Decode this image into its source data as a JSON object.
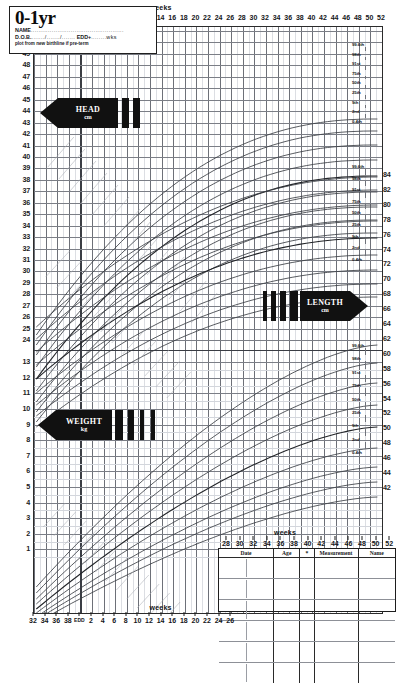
{
  "chart_data": {
    "type": "line",
    "title": "0-1yr",
    "subtitle": "UK-WHO growth chart, 0-1 year",
    "xlabel": "weeks",
    "x_axis": {
      "label": "weeks",
      "gestational_ticks": [
        "32",
        "34",
        "36",
        "38",
        "EDD"
      ],
      "postnatal_ticks": [
        "2",
        "4",
        "6",
        "8",
        "10",
        "12",
        "14",
        "16",
        "18",
        "20",
        "22",
        "24",
        "26",
        "28",
        "30",
        "32",
        "34",
        "36",
        "38",
        "40",
        "42",
        "44",
        "46",
        "48",
        "50",
        "52"
      ],
      "range_weeks": [
        32,
        52
      ],
      "edd_marker": "EDD"
    },
    "panels": [
      {
        "name": "head-circumference",
        "measure": "HEAD",
        "unit": "cm",
        "ylabel": "cm",
        "yticks": [
          "51",
          "50",
          "49",
          "48",
          "47",
          "46",
          "45",
          "44",
          "43",
          "42",
          "41",
          "40",
          "39",
          "38",
          "37",
          "36",
          "35",
          "34",
          "33",
          "32",
          "31",
          "30",
          "29",
          "28",
          "27",
          "26",
          "25",
          "24"
        ],
        "ylim": [
          24,
          51
        ],
        "percentiles": [
          "99.6th",
          "98th",
          "91st",
          "75th",
          "50th",
          "25th",
          "9th",
          "2nd",
          "0.4th"
        ]
      },
      {
        "name": "length",
        "measure": "LENGTH",
        "unit": "cm",
        "ylabel": "cm",
        "yticks_right": [
          "84",
          "82",
          "80",
          "78",
          "76",
          "74",
          "72",
          "70",
          "68",
          "66",
          "64",
          "62",
          "60",
          "58",
          "56",
          "54",
          "52",
          "50",
          "48",
          "46",
          "44",
          "42"
        ],
        "ylim": [
          42,
          84
        ],
        "percentiles": [
          "99.6th",
          "98th",
          "91st",
          "75th",
          "50th",
          "25th",
          "9th",
          "2nd",
          "0.4th"
        ]
      },
      {
        "name": "weight",
        "measure": "WEIGHT",
        "unit": "kg",
        "ylabel": "kg",
        "yticks": [
          "13",
          "12",
          "11",
          "10",
          "9",
          "8",
          "7",
          "6",
          "5",
          "4",
          "3",
          "2",
          "1"
        ],
        "ylim": [
          1,
          13
        ],
        "percentiles": [
          "99.6th",
          "98th",
          "91st",
          "75th",
          "50th",
          "25th",
          "9th",
          "2nd",
          "0.4th"
        ]
      }
    ],
    "grid": true,
    "legend_position": "right-inline-percentile-labels"
  },
  "header": {
    "title": "0-1yr",
    "name_label": "NAME",
    "name_dots": ".................................................",
    "dob_label": "D.O.B.",
    "dob_dots": "......./......./.......",
    "edd_label": "EDD+",
    "edd_dots": "........wks",
    "note": "plot from new birthline if pre-term"
  },
  "axis_labels": {
    "weeks_top": "weeks",
    "weeks_bottom": "weeks",
    "weeks_table": "weeks"
  },
  "measure_arrows": [
    {
      "id": "head",
      "label": "HEAD",
      "unit": "cm",
      "direction": "left",
      "bars": 2
    },
    {
      "id": "length",
      "label": "LENGTH",
      "unit": "cm",
      "direction": "right",
      "bars": 4
    },
    {
      "id": "weight",
      "label": "WEIGHT",
      "unit": "kg",
      "direction": "left",
      "bars": 4
    }
  ],
  "left_ticks_head": [
    "51",
    "50",
    "49",
    "48",
    "47",
    "46",
    "45",
    "44",
    "43",
    "42",
    "41",
    "40",
    "39",
    "38",
    "37",
    "36",
    "35",
    "34",
    "33",
    "32",
    "31",
    "30",
    "29",
    "28",
    "27",
    "26",
    "25",
    "24"
  ],
  "left_ticks_weight": [
    "13",
    "12",
    "11",
    "10",
    "9",
    "8",
    "7",
    "6",
    "5",
    "4",
    "3",
    "2",
    "1"
  ],
  "right_ticks_length": [
    "84",
    "82",
    "80",
    "78",
    "76",
    "74",
    "72",
    "70",
    "68",
    "66",
    "64",
    "62",
    "60",
    "58",
    "56",
    "54",
    "52",
    "50",
    "48",
    "46",
    "44",
    "42"
  ],
  "percentile_labels": [
    "99.6th",
    "98th",
    "91st",
    "75th",
    "50th",
    "25th",
    "9th",
    "2nd",
    "0.4th"
  ],
  "x_ticks_gest": [
    "32",
    "34",
    "36",
    "38",
    "EDD"
  ],
  "x_ticks_post": [
    "2",
    "4",
    "6",
    "8",
    "10",
    "12",
    "14",
    "16",
    "18",
    "20",
    "22",
    "24",
    "26",
    "28",
    "30",
    "32",
    "34",
    "36",
    "38",
    "40",
    "42",
    "44",
    "46",
    "48",
    "50",
    "52"
  ],
  "x_ticks_bottom_left": [
    "32",
    "34",
    "36",
    "38",
    "EDD",
    "2",
    "4",
    "6",
    "8",
    "10",
    "12",
    "14",
    "16",
    "18",
    "20",
    "22",
    "24",
    "26"
  ],
  "x_ticks_table_top": [
    "28",
    "30",
    "32",
    "34",
    "36",
    "38",
    "40",
    "42",
    "44",
    "46",
    "48",
    "50",
    "52"
  ],
  "data_table": {
    "columns": [
      "Date",
      "Age",
      "*",
      "Measurement",
      "Name"
    ],
    "rows": [
      {
        "date": "",
        "age": "",
        "star": "",
        "measurement": "",
        "name": ""
      },
      {
        "date": "",
        "age": "",
        "star": "",
        "measurement": "",
        "name": ""
      },
      {
        "date": "",
        "age": "",
        "star": "",
        "measurement": "",
        "name": ""
      },
      {
        "date": "",
        "age": "",
        "star": "",
        "measurement": "",
        "name": ""
      },
      {
        "date": "",
        "age": "",
        "star": "",
        "measurement": "",
        "name": ""
      },
      {
        "date": "",
        "age": "",
        "star": "",
        "measurement": "",
        "name": ""
      }
    ]
  },
  "colors": {
    "ink": "#1b1b1b",
    "grid": "#b9bcc4",
    "grid_major": "#6d7078",
    "curve": "#3b3e45",
    "curve_faint": "#a9acb4",
    "paper": "#ffffff"
  }
}
